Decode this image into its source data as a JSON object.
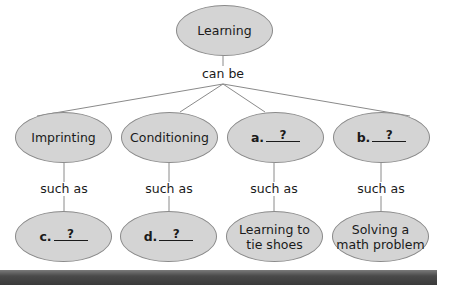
{
  "diagram": {
    "root": {
      "label": "Learning"
    },
    "root_connector": "can be",
    "branch_connector": "such as",
    "categories": [
      {
        "label": "Imprinting"
      },
      {
        "label": "Conditioning"
      },
      {
        "prefix": "a.",
        "blank": "?"
      },
      {
        "prefix": "b.",
        "blank": "?"
      }
    ],
    "examples": [
      {
        "prefix": "c.",
        "blank": "?"
      },
      {
        "prefix": "d.",
        "blank": "?"
      },
      {
        "line1": "Learning to",
        "line2": "tie shoes"
      },
      {
        "line1": "Solving a",
        "line2": "math problem"
      }
    ],
    "colors": {
      "node_fill": "#d4d4d4",
      "node_stroke": "#8a8a8a",
      "connector": "#8a8a8a",
      "bottom_bar": "#3a3a3a"
    }
  }
}
